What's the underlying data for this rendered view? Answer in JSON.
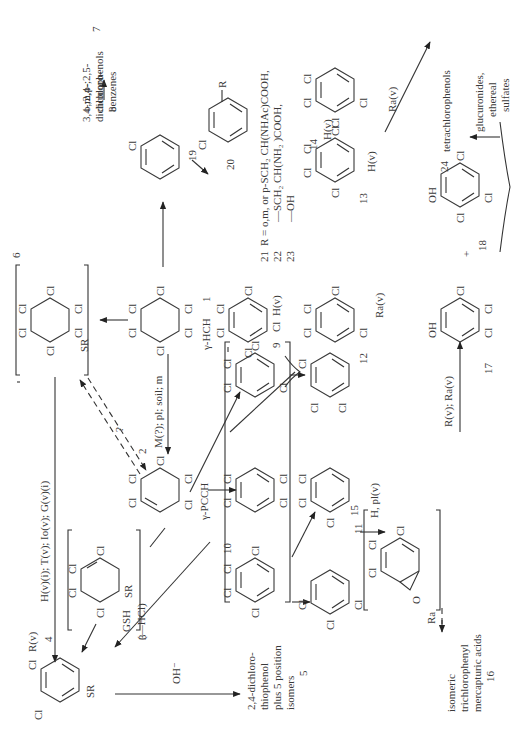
{
  "compounds": {
    "c1": {
      "number": "1",
      "name": "γ-HCH"
    },
    "c2": {
      "number": "2",
      "name": "γ-PCCH"
    },
    "c3": {
      "number": "3"
    },
    "c4": {
      "number": "4"
    },
    "c5": {
      "number": "5",
      "lines": [
        "2,4-dichloro-",
        "thiophenol",
        "plus 5 position",
        "isomers"
      ]
    },
    "c6": {
      "number": "6"
    },
    "c7": {
      "number": "7",
      "lines": [
        "o,m,p-",
        "dichloro-",
        "benzenes"
      ]
    },
    "c8": {
      "number": "8",
      "lines": [
        "3,4-;2,4-;2,5-",
        "dichlorophenols"
      ]
    },
    "c9": {
      "number": "9"
    },
    "c10": {
      "number": "10"
    },
    "c11": {
      "number": "11"
    },
    "c12": {
      "number": "12"
    },
    "c13": {
      "number": "13"
    },
    "c14": {
      "number": "14"
    },
    "c15": {
      "number": "15"
    },
    "c16": {
      "number": "16",
      "lines": [
        "isomeric",
        "trichlorophenyl",
        "mercapturic acids"
      ]
    },
    "c17": {
      "number": "17"
    },
    "c18": {
      "number": "18"
    },
    "c19": {
      "number": "19"
    },
    "c20": {
      "number": "20"
    },
    "c24": {
      "number": "24",
      "name": "tetrachlorophenols"
    }
  },
  "r_definitions": {
    "line21": {
      "number": "21",
      "text": "R = o,m, or p-SCH₂ CH(NHAc)COOH,"
    },
    "line22": {
      "number": "22",
      "text": "—SCH₂ CH(NH₂ )COOH,"
    },
    "line23": {
      "number": "23",
      "text": "—OH"
    }
  },
  "conjugates": {
    "lines": [
      "glucuronides,",
      "ethereal",
      "sulfates"
    ]
  },
  "reaction_labels": {
    "m_pl_soil": "M(?); pl; soil; m",
    "h_t_lo_g": "H(v)(i); T(v); Io(v); G(v)(i)",
    "gsh": "GSH",
    "minus_hcl": "(—HCl)",
    "oh_minus": "OH⁻",
    "r_v_4": "R(v)",
    "h_v_9": "H(v)",
    "ra_v_12": "Ra(v)",
    "h_v_13": "H(v)",
    "h_v_14": "H(v)",
    "ra_v_24": "Ra(v)",
    "h_pl_v": "H, pl(v)",
    "r_ra_v": "R(v); Ra(v)",
    "ra_16": "Ra",
    "question": "?",
    "plus": "+"
  },
  "atoms": {
    "cl": "Cl",
    "sr": "SR",
    "oh": "OH",
    "o": "O",
    "r": "R"
  }
}
